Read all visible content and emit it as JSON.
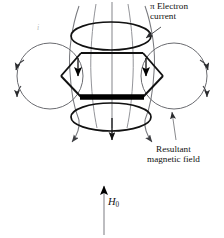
{
  "figure": {
    "background_color": "#ffffff",
    "width": 224,
    "height": 238
  },
  "labels": {
    "pi_electron_current": {
      "line1": "π Electron",
      "line2": "current",
      "color": "#111111"
    },
    "resultant_magnetic_field": {
      "line1": "Resultant",
      "line2": "magnetic field",
      "color": "#111111"
    },
    "applied_field": {
      "symbol": "H",
      "subscript": "0",
      "color": "#111111"
    },
    "current_i": {
      "symbol": "i",
      "color": "#b9b9b9"
    }
  },
  "elements": {
    "benzene_ring": {
      "name": "hexagon-benzene-ring",
      "stroke_color": "#111111",
      "bold_edge": "bottom"
    },
    "pi_current_loop_top": {
      "name": "ellipse-pi-current-top",
      "stroke_color": "#111111"
    },
    "pi_current_loop_bottom": {
      "name": "ellipse-pi-current-bottom",
      "stroke_color": "#111111"
    },
    "field_circle_left": {
      "name": "circle-field-left",
      "stroke_color": "#55565a",
      "arrowheads": 2
    },
    "field_circle_right": {
      "name": "circle-field-right",
      "stroke_color": "#55565a",
      "arrowheads": 2
    },
    "central_field_lines": {
      "name": "central-field-lines",
      "count": 3,
      "stroke_color": "#6a6b70",
      "direction": "downward"
    },
    "h0_arrow": {
      "name": "h0-field-arrow",
      "stroke_color": "#8a8a8c",
      "direction": "up"
    }
  },
  "colors": {
    "ink": "#111111",
    "gray_line": "#6a6b70",
    "light_gray": "#9a9a9d",
    "faint": "#b9b9b9"
  }
}
